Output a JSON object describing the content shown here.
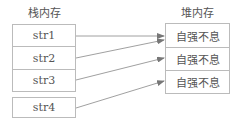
{
  "stack": {
    "title": "栈内存",
    "items": [
      "str1",
      "str2",
      "str3",
      "str4"
    ]
  },
  "heap": {
    "title": "堆内存",
    "items": [
      "自强不息",
      "自强不息",
      "自强不息"
    ]
  },
  "arrows": [
    {
      "from": "str1",
      "to": 0
    },
    {
      "from": "str2",
      "to": 0
    },
    {
      "from": "str3",
      "to": 1
    },
    {
      "from": "str4",
      "to": 2
    }
  ]
}
